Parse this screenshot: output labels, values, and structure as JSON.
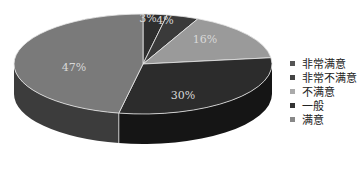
{
  "chart_data": {
    "type": "pie",
    "style": "3d",
    "title": "",
    "slices": [
      {
        "label": "非常满意",
        "value": 3,
        "display": "3%",
        "color": "#2e2e2e",
        "side": "#1c1c1c"
      },
      {
        "label": "非常不满意",
        "value": 4,
        "display": "4%",
        "color": "#3a3a3a",
        "side": "#222222"
      },
      {
        "label": "不满意",
        "value": 16,
        "display": "16%",
        "color": "#9a9a9a",
        "side": "#6a6a6a"
      },
      {
        "label": "一般",
        "value": 30,
        "display": "30%",
        "color": "#2c2c2c",
        "side": "#151515"
      },
      {
        "label": "满意",
        "value": 47,
        "display": "47%",
        "color": "#7a7a7a",
        "side": "#3c3c3c"
      }
    ],
    "legend_position": "right",
    "start_angle": "12 o'clock",
    "direction": "clockwise"
  },
  "legend": {
    "items": [
      {
        "label": "非常满意",
        "color": "#555555"
      },
      {
        "label": "非常不满意",
        "color": "#444444"
      },
      {
        "label": "不满意",
        "color": "#aaaaaa"
      },
      {
        "label": "一般",
        "color": "#333333"
      },
      {
        "label": "满意",
        "color": "#888888"
      }
    ]
  }
}
